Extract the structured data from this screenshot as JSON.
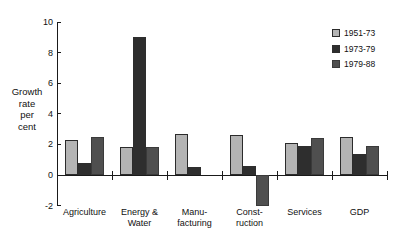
{
  "chart_data": {
    "type": "bar",
    "title": "",
    "xlabel": "",
    "ylabel": "Growth\nrate\nper\ncent",
    "ylim": [
      -2,
      10
    ],
    "yticks": [
      -2,
      0,
      2,
      4,
      6,
      8,
      10
    ],
    "ytick_labels": [
      "-2",
      "0",
      "2",
      "4",
      "6",
      "8",
      "10"
    ],
    "grid": false,
    "legend_position": "top-right",
    "categories": [
      "Agriculture",
      "Energy &\nWater",
      "Manu-\nfacturing",
      "Const-\nruction",
      "Services",
      "GDP"
    ],
    "series": [
      {
        "name": "1951-73",
        "color": "#b4b4b4",
        "values": [
          2.3,
          1.8,
          2.7,
          2.6,
          2.1,
          2.5
        ]
      },
      {
        "name": "1973-79",
        "color": "#2e2e2e",
        "values": [
          0.8,
          9.0,
          0.5,
          0.6,
          1.9,
          1.4
        ]
      },
      {
        "name": "1979-88",
        "color": "#4f4f4f",
        "values": [
          2.5,
          1.8,
          0.0,
          -2.0,
          2.4,
          1.9
        ]
      }
    ]
  },
  "legend": {
    "items": [
      {
        "label": "1951-73"
      },
      {
        "label": "1973-79"
      },
      {
        "label": "1979-88"
      }
    ]
  },
  "axis": {
    "y_title": "Growth\nrate\nper\ncent"
  }
}
